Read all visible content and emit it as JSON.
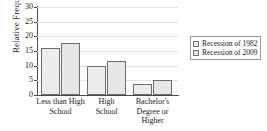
{
  "chart_data": {
    "type": "bar",
    "title": "",
    "xlabel": "",
    "ylabel": "Relative Frequency",
    "ylim": [
      0,
      30
    ],
    "yticks": [
      0,
      5,
      10,
      15,
      20,
      25,
      30
    ],
    "ytick_labels": [
      "0",
      "5",
      "10",
      "15",
      "20",
      "25",
      "30"
    ],
    "grid": true,
    "legend_position": "right",
    "categories": [
      "Less than High School",
      "High School",
      "Bachelor's Degree or Higher"
    ],
    "category_lines": [
      [
        "Less than High",
        "School"
      ],
      [
        "High",
        "School"
      ],
      [
        "Bachelor's",
        "Degree or",
        "Higher"
      ]
    ],
    "series": [
      {
        "name": "Recession of 1982",
        "values": [
          16.0,
          10.0,
          3.8
        ],
        "color": "#eceded"
      },
      {
        "name": "Recession of 2009",
        "values": [
          17.7,
          11.7,
          5.0
        ],
        "color": "#e6e7e8"
      }
    ]
  },
  "legend": {
    "entries": [
      {
        "label": "Recession of 1982",
        "swatch": "legend-swatch-1982"
      },
      {
        "label": "Recession of 2009",
        "swatch": "legend-swatch-2009"
      }
    ]
  }
}
